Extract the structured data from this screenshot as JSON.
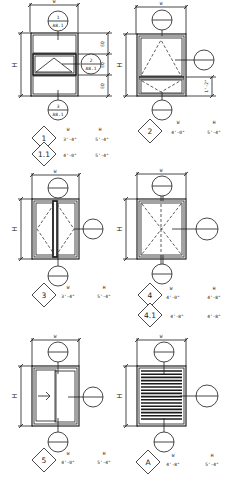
{
  "drawing": {
    "title": "Window Type Schedule Elevations",
    "dimension_labels": {
      "width": "W",
      "height": "H"
    },
    "line_color": "#1a1a1a",
    "background": "#ffffff"
  },
  "panels": [
    {
      "id": "type-1",
      "description": "Stacked three-light window with awning sash in middle",
      "section_tags": [
        {
          "num": "1",
          "sheet": "A8.1"
        },
        {
          "num": "2",
          "sheet": "A8.1"
        },
        {
          "num": "3",
          "sheet": "A8.1"
        }
      ],
      "side_dims": [
        "EQ",
        "EQ",
        "EQ"
      ],
      "types": [
        {
          "mark": "1",
          "w_label": "W",
          "h_label": "H",
          "w": "3'-4\"",
          "h": "5'-4\""
        },
        {
          "mark": "1.1",
          "w": "4'-0\"",
          "h": "5'-4\""
        }
      ]
    },
    {
      "id": "type-2",
      "description": "Fixed upper light over awning lower sash",
      "side_dims": [
        "1'-2\""
      ],
      "types": [
        {
          "mark": "2",
          "w_label": "W",
          "h_label": "H",
          "w": "4'-0\"",
          "h": "5'-4\""
        }
      ]
    },
    {
      "id": "type-3",
      "description": "Pair of casement sashes",
      "types": [
        {
          "mark": "3",
          "w_label": "W",
          "h_label": "H",
          "w": "3'-4\"",
          "h": "5'-4\""
        }
      ]
    },
    {
      "id": "type-4",
      "description": "Single hopper/fixed with cross dashes",
      "types": [
        {
          "mark": "4",
          "w_label": "W",
          "h_label": "H",
          "w": "4'-0\"",
          "h": "4'-8\""
        },
        {
          "mark": "4.1",
          "w": "4'-8\"",
          "h": "4'-8\""
        }
      ]
    },
    {
      "id": "type-5",
      "description": "Horizontal sliding window",
      "types": [
        {
          "mark": "5",
          "w_label": "W",
          "h_label": "H",
          "w": "4'-0\"",
          "h": "5'-4\""
        }
      ]
    },
    {
      "id": "type-A",
      "description": "Louvered panel",
      "types": [
        {
          "mark": "A",
          "w_label": "W",
          "h_label": "H",
          "w": "4'-8\"",
          "h": "5'-4\""
        }
      ]
    }
  ]
}
